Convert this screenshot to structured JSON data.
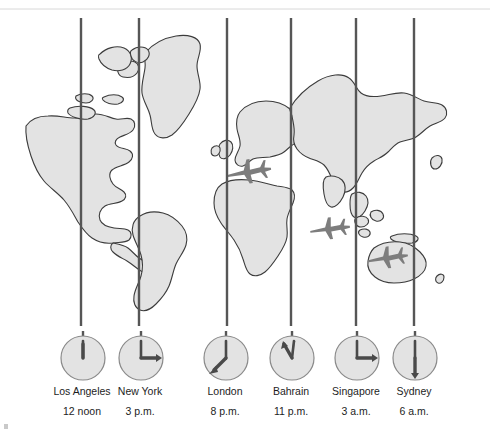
{
  "figure": {
    "map": {
      "name": "world-map",
      "land_fill": "#e3e3e3",
      "land_stroke": "#3c3c3c",
      "background": "#ffffff",
      "meridian_color": "#565656",
      "meridian_count": 6,
      "meridian_x": [
        81,
        139,
        227,
        291,
        356,
        414
      ],
      "airplane_color": "#7d7d7d",
      "airplanes": [
        {
          "name": "airplane-mediterranean",
          "x": 248,
          "y": 163,
          "rotation": -8
        },
        {
          "name": "airplane-indian-ocean",
          "x": 329,
          "y": 220,
          "rotation": -6
        },
        {
          "name": "airplane-australia",
          "x": 387,
          "y": 249,
          "rotation": -7
        }
      ]
    },
    "clocks": [
      {
        "id": "los-angeles",
        "city": "Los Angeles",
        "time": "12 noon",
        "hour_angle": 0,
        "minute_angle": 0,
        "center_x": 82
      },
      {
        "id": "new-york",
        "city": "New York",
        "time": "3 p.m.",
        "hour_angle": 90,
        "minute_angle": 0,
        "center_x": 140
      },
      {
        "id": "london",
        "city": "London",
        "time": "8 p.m.",
        "hour_angle": 240,
        "minute_angle": 0,
        "center_x": 225
      },
      {
        "id": "bahrain",
        "city": "Bahrain",
        "time": "11 p.m.",
        "hour_angle": 330,
        "minute_angle": 0,
        "center_x": 291
      },
      {
        "id": "singapore",
        "city": "Singapore",
        "time": "3 a.m.",
        "hour_angle": 90,
        "minute_angle": 0,
        "center_x": 356
      },
      {
        "id": "sydney",
        "city": "Sydney",
        "time": "6 a.m.",
        "hour_angle": 180,
        "minute_angle": 0,
        "center_x": 414
      }
    ],
    "clock_style": {
      "face_fill": "#e3e3e3",
      "face_stroke": "#8a8a8a",
      "hand_color": "#4a4a4a",
      "radius": 23
    }
  }
}
